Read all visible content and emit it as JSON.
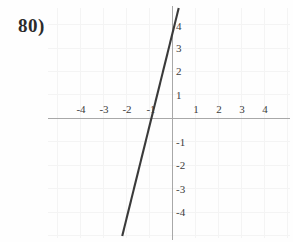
{
  "problem": {
    "number_label": "80)"
  },
  "chart_data": {
    "type": "line",
    "title": "",
    "subtitle": "",
    "xlabel": "",
    "ylabel": "",
    "xlim": [
      -5.1,
      5.2
    ],
    "ylim": [
      -5.0,
      4.9
    ],
    "grid": true,
    "grid_visible_faint": true,
    "legend": null,
    "legend_position": "none",
    "annotations": [],
    "x_tick_labels": [
      "-4",
      "-3",
      "-2",
      "-1",
      "1",
      "2",
      "3",
      "4"
    ],
    "x_tick_values": [
      -4,
      -3,
      -2,
      -1,
      1,
      2,
      3,
      4
    ],
    "y_tick_labels": [
      "4",
      "3",
      "2",
      "1",
      "-1",
      "-2",
      "-3",
      "-4"
    ],
    "y_tick_values": [
      4,
      3,
      2,
      1,
      -1,
      -2,
      -3,
      -4
    ],
    "series": [
      {
        "name": "line",
        "kind": "line",
        "slope": 4,
        "intercept": 3.6,
        "x_intercept": -0.9,
        "x": [
          -1.95,
          0.35
        ],
        "y": [
          -4.2,
          5.0
        ],
        "color": "#3a3a3a"
      }
    ],
    "colors": {
      "line": "#3a3a3a",
      "axis": "#a8a8a8",
      "grid": "#f4f4f4",
      "tick_text": "#3c3c3c",
      "background": "#fefefe",
      "problem_number": "#2b2b2b"
    }
  }
}
